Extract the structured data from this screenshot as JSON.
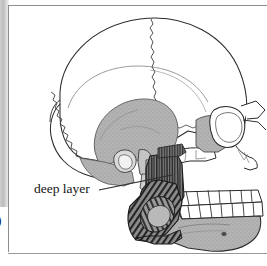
{
  "figure": {
    "kind": "anatomical-illustration",
    "annotations": [
      {
        "id": "deep-layer",
        "label": "deep layer",
        "leader": "line from label running up and to the right to the vertically-striated muscle fibres behind the ramus of the mandible",
        "label_x": 34,
        "label_y": 188
      }
    ],
    "page_number_fragment": "0",
    "palette": {
      "paper": "#ffffff",
      "outline": "#2b2b2b",
      "bone_fill": "#ffffff",
      "shaded_bone": "#aaaaaa",
      "shaded_bone_light": "#c2c2c2",
      "muscle_dark": "#3a3a3a",
      "muscle_mid": "#6e6e6e",
      "frame": "#8e8e8e",
      "gutter": "#c4c4c4",
      "label_text": "#1a1a1a"
    },
    "regions": [
      {
        "name": "cranial-vault",
        "fill": "white",
        "note": "large rounded neurocranium occupying the upper two-thirds"
      },
      {
        "name": "coronal-suture",
        "fill": "none",
        "note": "zigzag suture descending from the vertex toward the front"
      },
      {
        "name": "lambdoid-suture",
        "fill": "none",
        "note": "zigzag suture on the posterior (left) aspect"
      },
      {
        "name": "temporal-fossa",
        "fill": "shaded_bone",
        "note": "large stippled grey area in the middle of the skull"
      },
      {
        "name": "zygomatic-arch",
        "fill": "white",
        "note": "bar of bone crossing in front of the ear region"
      },
      {
        "name": "orbit",
        "fill": "white",
        "note": "eye socket at the right (anterior) margin"
      },
      {
        "name": "maxilla-upper-teeth",
        "fill": "white",
        "note": "upper dental arcade"
      },
      {
        "name": "mandible-lower-teeth",
        "fill": "white",
        "note": "lower dental arcade"
      },
      {
        "name": "mandible-body",
        "fill": "shaded_bone",
        "note": "grey lower jaw with mental foramen"
      },
      {
        "name": "masseter-deep-layer",
        "fill": "muscle_dark",
        "note": "vertically striated muscle fibres behind and below the zygomatic arch"
      },
      {
        "name": "masseter-superficial-hatch",
        "fill": "muscle_mid",
        "note": "obliquely hatched muscle over the angle of the mandible"
      }
    ]
  }
}
